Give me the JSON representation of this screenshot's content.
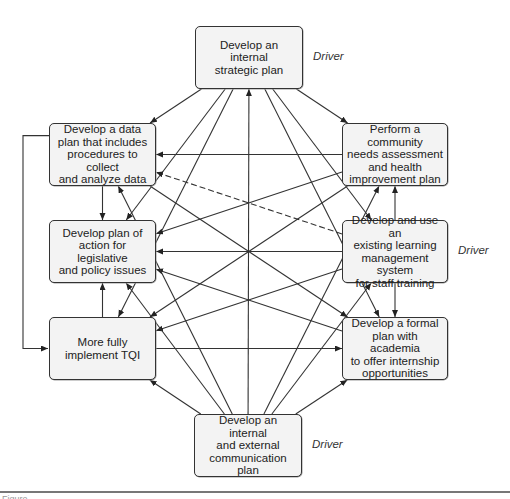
{
  "diagram": {
    "nodes": [
      {
        "id": "strategic",
        "label": "Develop an internal\nstrategic plan",
        "x": 195,
        "y": 26,
        "w": 108,
        "h": 63,
        "driver": true
      },
      {
        "id": "data",
        "label": "Develop a data\nplan that includes\nprocedures to collect\nand analyze data",
        "x": 49,
        "y": 123,
        "w": 107,
        "h": 63,
        "driver": false
      },
      {
        "id": "community",
        "label": "Perform a community\nneeds assessment\nand health\nimprovement plan",
        "x": 342,
        "y": 123,
        "w": 106,
        "h": 63,
        "driver": false
      },
      {
        "id": "legislative",
        "label": "Develop plan of\naction for legislative\nand policy issues",
        "x": 49,
        "y": 220,
        "w": 107,
        "h": 63,
        "driver": false
      },
      {
        "id": "lms",
        "label": "Develop and use an\nexisting learning\nmanagement system\nfor staff training",
        "x": 342,
        "y": 220,
        "w": 106,
        "h": 63,
        "driver": true
      },
      {
        "id": "tqi",
        "label": "More fully\nimplement TQI",
        "x": 49,
        "y": 317,
        "w": 107,
        "h": 63,
        "driver": false
      },
      {
        "id": "academia",
        "label": "Develop a formal\nplan with academia\nto offer internship\nopportunities",
        "x": 342,
        "y": 317,
        "w": 106,
        "h": 63,
        "driver": false
      },
      {
        "id": "communication",
        "label": "Develop an internal\nand external\ncommunication plan",
        "x": 194,
        "y": 414,
        "w": 108,
        "h": 63,
        "driver": true
      }
    ],
    "driver_label": "Driver",
    "edges": [
      {
        "from": "strategic",
        "to": "data"
      },
      {
        "from": "strategic",
        "to": "community"
      },
      {
        "from": "strategic",
        "to": "legislative"
      },
      {
        "from": "strategic",
        "to": "tqi"
      },
      {
        "from": "strategic",
        "to": "lms"
      },
      {
        "from": "strategic",
        "to": "academia"
      },
      {
        "from": "communication",
        "to": "strategic"
      },
      {
        "from": "community",
        "to": "data"
      },
      {
        "from": "lms",
        "to": "data",
        "dashed": true
      },
      {
        "from": "data",
        "to": "legislative"
      },
      {
        "from": "data",
        "to": "tqi",
        "elbow": true
      },
      {
        "from": "lms",
        "to": "community"
      },
      {
        "from": "lms",
        "to": "academia"
      },
      {
        "from": "tqi",
        "to": "legislative"
      },
      {
        "from": "community",
        "to": "legislative"
      },
      {
        "from": "lms",
        "to": "legislative"
      },
      {
        "from": "academia",
        "to": "legislative"
      },
      {
        "from": "community",
        "to": "tqi"
      },
      {
        "from": "lms",
        "to": "tqi"
      },
      {
        "from": "tqi",
        "to": "academia"
      },
      {
        "from": "data",
        "to": "academia"
      },
      {
        "from": "communication",
        "to": "tqi"
      },
      {
        "from": "communication",
        "to": "academia"
      },
      {
        "from": "communication",
        "to": "data"
      },
      {
        "from": "communication",
        "to": "legislative"
      },
      {
        "from": "communication",
        "to": "community"
      },
      {
        "from": "communication",
        "to": "lms"
      }
    ]
  },
  "caption": "Figure"
}
